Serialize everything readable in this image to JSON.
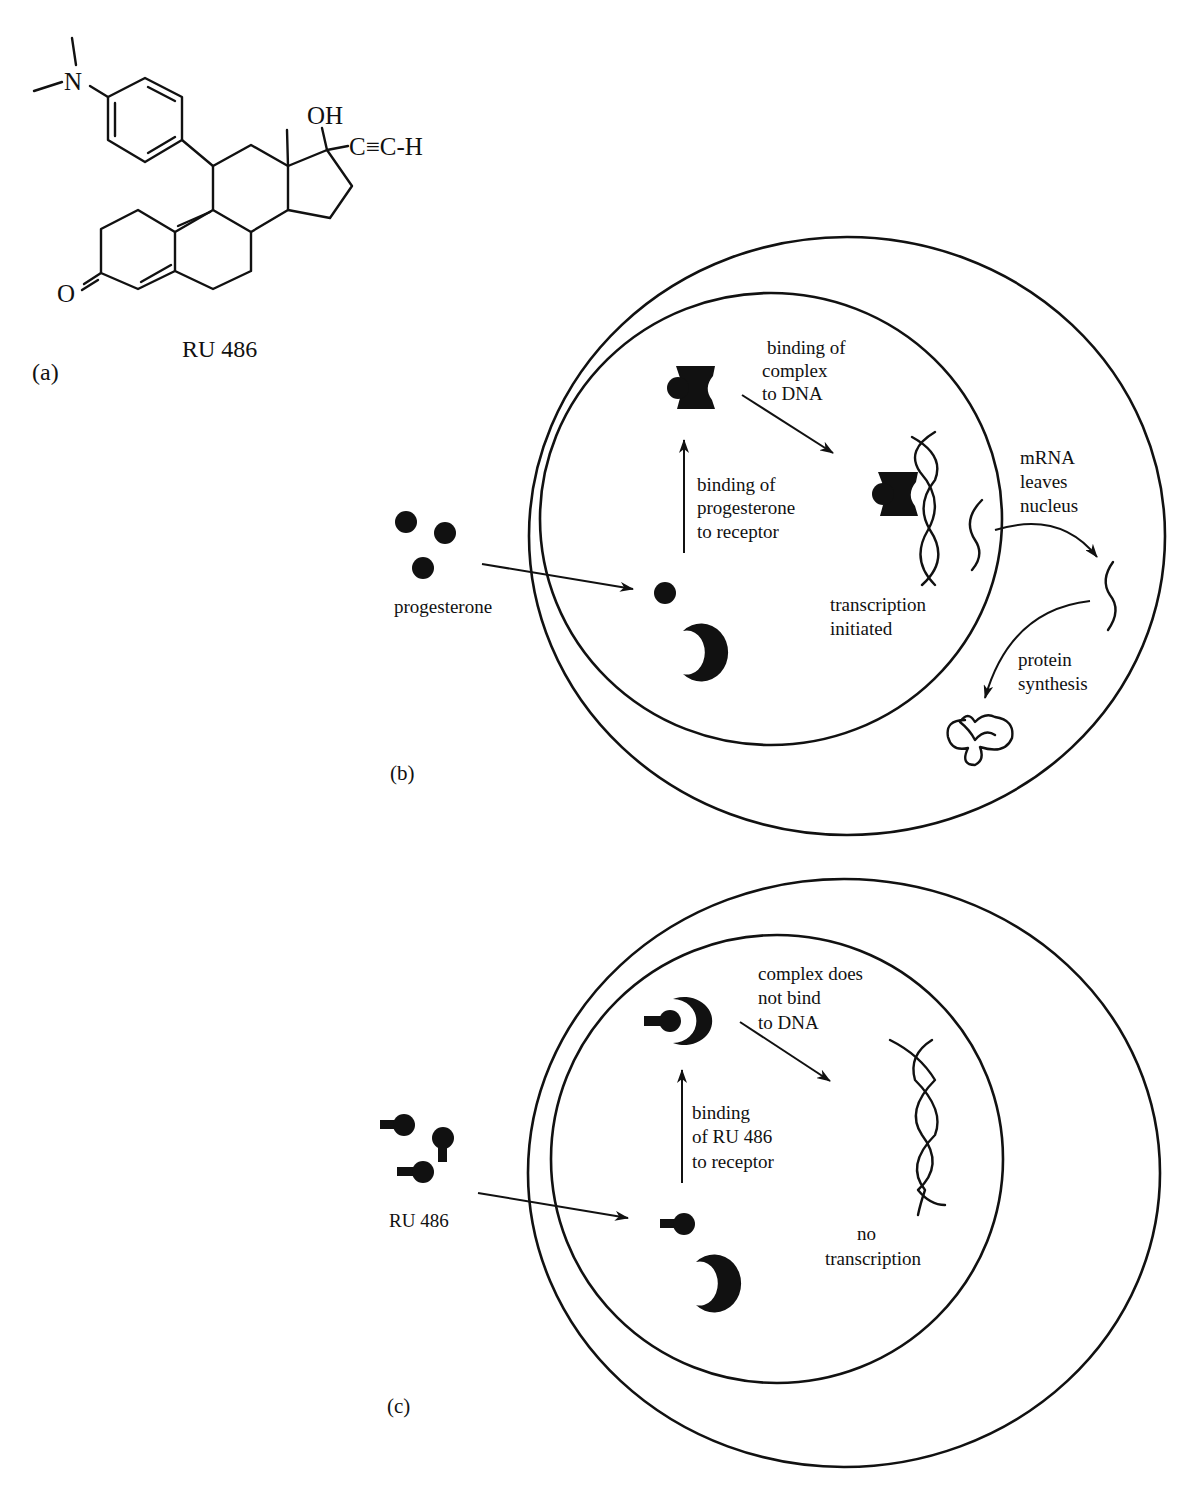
{
  "panel_a": {
    "label": "(a)",
    "molecule_name": "RU 486",
    "atoms": {
      "nitrogen": "N",
      "hydroxyl": "OH",
      "alkyne": "C≡C-H",
      "ketone_oxygen": "O"
    }
  },
  "panel_b": {
    "label": "(b)",
    "ligand_label": "progesterone",
    "step1_label": [
      "binding of",
      "progesterone",
      "to receptor"
    ],
    "step2_label": [
      "binding of",
      "complex",
      "to DNA"
    ],
    "result_label": [
      "transcription",
      "initiated"
    ],
    "export_label": [
      "mRNA",
      "leaves",
      "nucleus"
    ],
    "synthesis_label": [
      "protein",
      "synthesis"
    ]
  },
  "panel_c": {
    "label": "(c)",
    "ligand_label": "RU 486",
    "step1_label": [
      "binding",
      "of RU 486",
      "to receptor"
    ],
    "step2_label": [
      "complex does",
      "not bind",
      "to DNA"
    ],
    "result_label": [
      "no",
      "transcription"
    ]
  },
  "colors": {
    "ink": "#111111",
    "background": "#ffffff"
  }
}
